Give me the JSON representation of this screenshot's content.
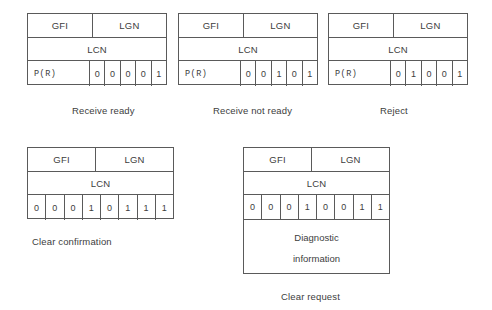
{
  "diagram": {
    "field_labels": {
      "gfi": "GFI",
      "lgn": "LGN",
      "lcn": "LCN",
      "pr": "P(R)"
    },
    "packets": [
      {
        "id": "receive-ready",
        "caption": "Receive ready",
        "has_pr": true,
        "bits": [
          "0",
          "0",
          "0",
          "0",
          "1"
        ],
        "diagnostic": null
      },
      {
        "id": "receive-not-ready",
        "caption": "Receive not ready",
        "has_pr": true,
        "bits": [
          "0",
          "0",
          "1",
          "0",
          "1"
        ],
        "diagnostic": null
      },
      {
        "id": "reject",
        "caption": "Reject",
        "has_pr": true,
        "bits": [
          "0",
          "1",
          "0",
          "0",
          "1"
        ],
        "diagnostic": null
      },
      {
        "id": "clear-confirmation",
        "caption": "Clear confirmation",
        "has_pr": false,
        "bits": [
          "0",
          "0",
          "0",
          "1",
          "0",
          "1",
          "1",
          "1"
        ],
        "diagnostic": null
      },
      {
        "id": "clear-request",
        "caption": "Clear request",
        "has_pr": false,
        "bits": [
          "0",
          "0",
          "0",
          "1",
          "0",
          "0",
          "1",
          "1"
        ],
        "diagnostic": {
          "line1": "Diagnostic",
          "line2": "information"
        }
      }
    ],
    "colors": {
      "line": "#5a5a5a",
      "text": "#3d3d3d",
      "background": "#ffffff"
    }
  }
}
